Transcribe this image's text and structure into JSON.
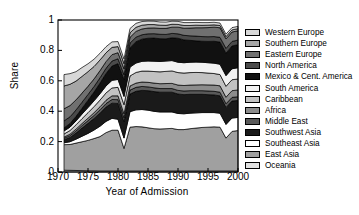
{
  "chart_data": {
    "type": "area",
    "stacked": true,
    "title": "",
    "xlabel": "Year of Admission",
    "ylabel": "Share",
    "xlim": [
      1970,
      2000
    ],
    "ylim": [
      0,
      1
    ],
    "xticks": [
      1970,
      1975,
      1980,
      1985,
      1990,
      1995,
      2000
    ],
    "xtick_labels": [
      "1970",
      "1975",
      "1980",
      "1985",
      "1990",
      "1995",
      "2000"
    ],
    "yticks": [
      0,
      0.2,
      0.4,
      0.6,
      0.8,
      1
    ],
    "ytick_labels": [
      "0",
      "0.2",
      "0.4",
      "0.6",
      "0.8",
      "1"
    ],
    "grid": false,
    "legend_position": "right",
    "x": [
      1971,
      1972,
      1973,
      1974,
      1975,
      1976,
      1977,
      1978,
      1979,
      1980,
      1981,
      1982,
      1983,
      1984,
      1985,
      1986,
      1987,
      1988,
      1989,
      1990,
      1991,
      1992,
      1993,
      1994,
      1995,
      1996,
      1997,
      1998,
      1999,
      2000
    ],
    "stack_order_bottom_to_top": [
      "Oceania",
      "East Asia",
      "Southeast Asia",
      "Southwest Asia",
      "Middle East",
      "Africa",
      "Caribbean",
      "South America",
      "Mexico & Cent. America",
      "North America",
      "Eastern Europe",
      "Southern Europe",
      "Western Europe"
    ],
    "series": [
      {
        "name": "Western Europe",
        "color": "#d8d8d8",
        "values": [
          0.075,
          0.07,
          0.062,
          0.058,
          0.052,
          0.048,
          0.044,
          0.04,
          0.036,
          0.033,
          0.03,
          0.028,
          0.026,
          0.024,
          0.023,
          0.022,
          0.021,
          0.021,
          0.02,
          0.02,
          0.019,
          0.019,
          0.018,
          0.018,
          0.017,
          0.017,
          0.016,
          0.016,
          0.015,
          0.015
        ]
      },
      {
        "name": "Southern Europe",
        "color": "#a6a6a6",
        "values": [
          0.15,
          0.14,
          0.124,
          0.11,
          0.096,
          0.082,
          0.07,
          0.058,
          0.048,
          0.04,
          0.034,
          0.03,
          0.027,
          0.025,
          0.023,
          0.022,
          0.021,
          0.02,
          0.019,
          0.018,
          0.018,
          0.017,
          0.017,
          0.016,
          0.016,
          0.015,
          0.015,
          0.015,
          0.014,
          0.014
        ]
      },
      {
        "name": "Eastern Europe",
        "color": "#707070",
        "values": [
          0.08,
          0.074,
          0.066,
          0.06,
          0.054,
          0.05,
          0.047,
          0.044,
          0.042,
          0.04,
          0.039,
          0.038,
          0.038,
          0.038,
          0.038,
          0.038,
          0.039,
          0.04,
          0.041,
          0.044,
          0.047,
          0.051,
          0.055,
          0.058,
          0.06,
          0.062,
          0.063,
          0.063,
          0.062,
          0.061
        ]
      },
      {
        "name": "North America",
        "color": "#4a4a4a",
        "values": [
          0.046,
          0.044,
          0.042,
          0.04,
          0.038,
          0.036,
          0.035,
          0.034,
          0.033,
          0.032,
          0.031,
          0.03,
          0.03,
          0.029,
          0.029,
          0.029,
          0.029,
          0.029,
          0.029,
          0.029,
          0.03,
          0.03,
          0.031,
          0.031,
          0.031,
          0.031,
          0.031,
          0.031,
          0.03,
          0.03
        ]
      },
      {
        "name": "Mexico & Cent. America",
        "color": "#111111",
        "values": [
          0.02,
          0.024,
          0.03,
          0.038,
          0.048,
          0.058,
          0.07,
          0.082,
          0.094,
          0.104,
          0.112,
          0.128,
          0.14,
          0.146,
          0.15,
          0.152,
          0.15,
          0.146,
          0.15,
          0.158,
          0.15,
          0.144,
          0.14,
          0.138,
          0.14,
          0.144,
          0.146,
          0.148,
          0.15,
          0.152
        ]
      },
      {
        "name": "South America",
        "color": "#f2f2f2",
        "values": [
          0.02,
          0.022,
          0.026,
          0.03,
          0.034,
          0.038,
          0.042,
          0.046,
          0.05,
          0.052,
          0.054,
          0.058,
          0.062,
          0.064,
          0.066,
          0.068,
          0.068,
          0.068,
          0.068,
          0.068,
          0.068,
          0.068,
          0.068,
          0.068,
          0.068,
          0.068,
          0.068,
          0.07,
          0.072,
          0.074
        ]
      },
      {
        "name": "Caribbean",
        "color": "#c2c2c2",
        "values": [
          0.02,
          0.024,
          0.028,
          0.032,
          0.036,
          0.04,
          0.044,
          0.048,
          0.052,
          0.056,
          0.06,
          0.066,
          0.07,
          0.072,
          0.074,
          0.076,
          0.078,
          0.08,
          0.082,
          0.082,
          0.082,
          0.082,
          0.082,
          0.08,
          0.078,
          0.076,
          0.074,
          0.072,
          0.072,
          0.072
        ]
      },
      {
        "name": "Africa",
        "color": "#8c8c8c",
        "values": [
          0.008,
          0.01,
          0.012,
          0.014,
          0.016,
          0.018,
          0.02,
          0.022,
          0.024,
          0.025,
          0.026,
          0.027,
          0.028,
          0.029,
          0.03,
          0.031,
          0.032,
          0.033,
          0.034,
          0.035,
          0.036,
          0.037,
          0.038,
          0.039,
          0.04,
          0.041,
          0.042,
          0.043,
          0.044,
          0.045
        ]
      },
      {
        "name": "Middle East",
        "color": "#595959",
        "values": [
          0.01,
          0.012,
          0.014,
          0.016,
          0.018,
          0.02,
          0.022,
          0.023,
          0.024,
          0.025,
          0.026,
          0.026,
          0.026,
          0.026,
          0.025,
          0.025,
          0.024,
          0.024,
          0.024,
          0.024,
          0.024,
          0.024,
          0.024,
          0.024,
          0.024,
          0.024,
          0.024,
          0.024,
          0.024,
          0.024
        ]
      },
      {
        "name": "Southwest Asia",
        "color": "#1a1a1a",
        "values": [
          0.02,
          0.028,
          0.04,
          0.054,
          0.066,
          0.076,
          0.086,
          0.094,
          0.1,
          0.104,
          0.108,
          0.116,
          0.122,
          0.126,
          0.128,
          0.13,
          0.13,
          0.13,
          0.13,
          0.128,
          0.126,
          0.124,
          0.122,
          0.12,
          0.118,
          0.116,
          0.114,
          0.112,
          0.112,
          0.112
        ]
      },
      {
        "name": "Southeast Asia",
        "color": "#ffffff",
        "values": [
          0.012,
          0.018,
          0.026,
          0.036,
          0.046,
          0.056,
          0.068,
          0.074,
          0.078,
          0.072,
          0.068,
          0.102,
          0.11,
          0.114,
          0.116,
          0.114,
          0.112,
          0.11,
          0.108,
          0.106,
          0.104,
          0.102,
          0.1,
          0.098,
          0.096,
          0.094,
          0.092,
          0.09,
          0.088,
          0.086
        ]
      },
      {
        "name": "East Asia",
        "color": "#a0a0a0",
        "values": [
          0.168,
          0.17,
          0.18,
          0.19,
          0.2,
          0.212,
          0.226,
          0.252,
          0.268,
          0.268,
          0.148,
          0.288,
          0.292,
          0.29,
          0.284,
          0.278,
          0.276,
          0.278,
          0.28,
          0.272,
          0.272,
          0.278,
          0.282,
          0.286,
          0.288,
          0.29,
          0.288,
          0.216,
          0.26,
          0.266
        ]
      },
      {
        "name": "Oceania",
        "color": "#e0e0e0",
        "values": [
          0.012,
          0.011,
          0.01,
          0.009,
          0.008,
          0.008,
          0.007,
          0.007,
          0.007,
          0.007,
          0.007,
          0.007,
          0.007,
          0.007,
          0.007,
          0.007,
          0.007,
          0.007,
          0.007,
          0.007,
          0.007,
          0.007,
          0.007,
          0.007,
          0.007,
          0.007,
          0.007,
          0.007,
          0.007,
          0.007
        ]
      }
    ]
  },
  "legend": {
    "items": [
      {
        "label": "Western Europe",
        "color": "#d8d8d8"
      },
      {
        "label": "Southern Europe",
        "color": "#a6a6a6"
      },
      {
        "label": "Eastern Europe",
        "color": "#707070"
      },
      {
        "label": "North America",
        "color": "#4a4a4a"
      },
      {
        "label": "Mexico & Cent. America",
        "color": "#111111"
      },
      {
        "label": "South America",
        "color": "#f2f2f2"
      },
      {
        "label": "Caribbean",
        "color": "#c2c2c2"
      },
      {
        "label": "Africa",
        "color": "#8c8c8c"
      },
      {
        "label": "Middle East",
        "color": "#595959"
      },
      {
        "label": "Southwest Asia",
        "color": "#1a1a1a"
      },
      {
        "label": "Southeast Asia",
        "color": "#ffffff"
      },
      {
        "label": "East Asia",
        "color": "#a0a0a0"
      },
      {
        "label": "Oceania",
        "color": "#e0e0e0"
      }
    ]
  }
}
